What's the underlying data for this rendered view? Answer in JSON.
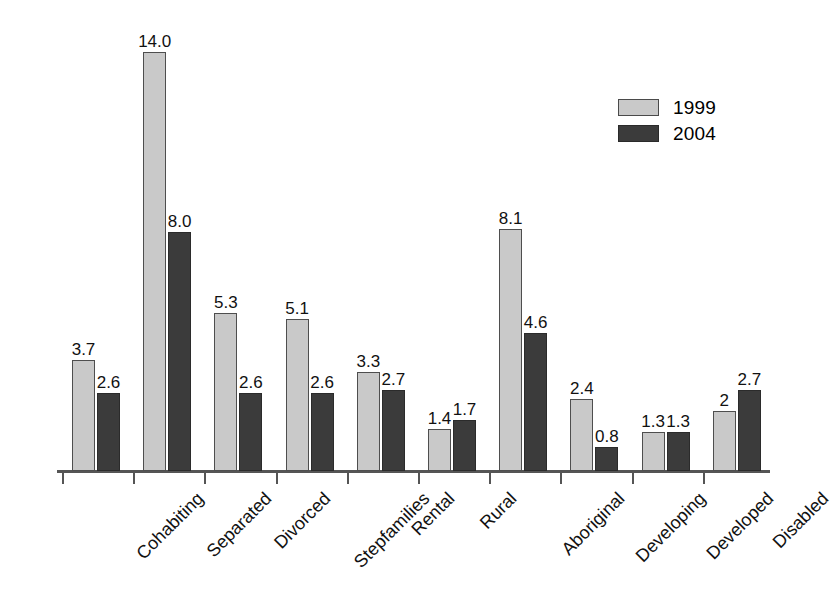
{
  "chart_data": {
    "type": "bar",
    "title": "",
    "subtitle": "",
    "xlabel": "",
    "ylabel": "",
    "ylim": [
      0,
      14.6
    ],
    "grid": false,
    "legend_position": "top-right",
    "categories": [
      "Cohabiting",
      "Separated",
      "Divorced",
      "Stepfamilies",
      "Rental",
      "Rural",
      "Aboriginal",
      "Developing",
      "Developed",
      "Disabled"
    ],
    "series": [
      {
        "name": "1999",
        "color": "#c9c9c9",
        "values": [
          3.7,
          14.0,
          5.3,
          5.1,
          3.3,
          1.4,
          8.1,
          2.4,
          1.3,
          2.0
        ],
        "labels": [
          "3.7",
          "14.0",
          "5.3",
          "5.1",
          "3.3",
          "1.4",
          "8.1",
          "2.4",
          "1.3",
          "2"
        ]
      },
      {
        "name": "2004",
        "color": "#3b3b3b",
        "values": [
          2.6,
          8.0,
          2.6,
          2.6,
          2.7,
          1.7,
          4.6,
          0.8,
          1.3,
          2.7
        ],
        "labels": [
          "2.6",
          "8.0",
          "2.6",
          "2.6",
          "2.7",
          "1.7",
          "4.6",
          "0.8",
          "1.3",
          "2.7"
        ]
      }
    ]
  },
  "legend": {
    "items": [
      {
        "label": "1999",
        "swatch": "light-gray-swatch-icon"
      },
      {
        "label": "2004",
        "swatch": "dark-gray-swatch-icon"
      }
    ]
  }
}
